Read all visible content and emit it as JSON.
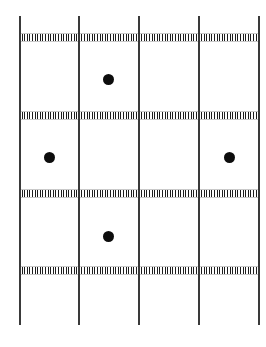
{
  "figure": {
    "type": "diagram",
    "width": 266,
    "height": 347,
    "background_color": "#ffffff",
    "line_color": "#3a3a3a",
    "band_color": "#1d1d1d",
    "dot_color": "#0d0d0d"
  },
  "vertical_lines": [
    {
      "name": "vertical-line-1",
      "x": 19,
      "y_top": 16,
      "y_bottom": 325,
      "thickness": 2
    },
    {
      "name": "vertical-line-2",
      "x": 78,
      "y_top": 16,
      "y_bottom": 325,
      "thickness": 2
    },
    {
      "name": "vertical-line-3",
      "x": 138,
      "y_top": 16,
      "y_bottom": 325,
      "thickness": 2
    },
    {
      "name": "vertical-line-4",
      "x": 198,
      "y_top": 16,
      "y_bottom": 325,
      "thickness": 2
    },
    {
      "name": "vertical-line-5",
      "x": 258,
      "y_top": 16,
      "y_bottom": 325,
      "thickness": 2
    }
  ],
  "horizontal_bands": [
    {
      "name": "hatched-band-1",
      "y": 34,
      "height": 7,
      "x_start": 19,
      "x_end": 259
    },
    {
      "name": "hatched-band-2",
      "y": 112,
      "height": 7,
      "x_start": 19,
      "x_end": 259
    },
    {
      "name": "hatched-band-3",
      "y": 190,
      "height": 7,
      "x_start": 19,
      "x_end": 259
    },
    {
      "name": "hatched-band-4",
      "y": 267,
      "height": 7,
      "x_start": 19,
      "x_end": 259
    }
  ],
  "dots": [
    {
      "name": "dot-top-center",
      "cx": 108,
      "cy": 79,
      "r": 5.5
    },
    {
      "name": "dot-middle-left",
      "cx": 49,
      "cy": 157,
      "r": 5.5
    },
    {
      "name": "dot-middle-right",
      "cx": 229,
      "cy": 157,
      "r": 5.5
    },
    {
      "name": "dot-lower-center",
      "cx": 108,
      "cy": 236,
      "r": 5.5
    }
  ]
}
